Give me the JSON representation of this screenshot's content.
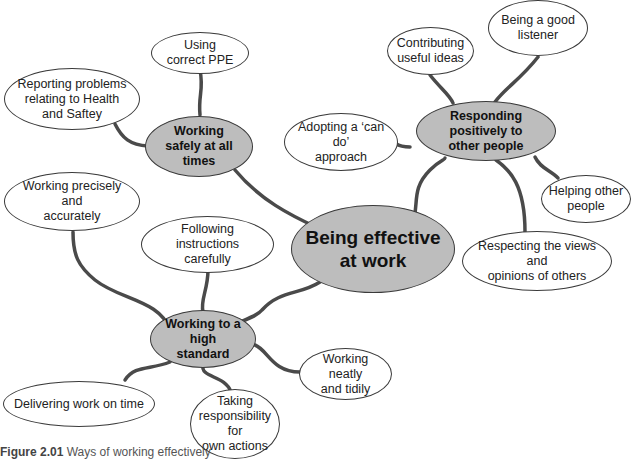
{
  "center": {
    "label_line1": "Being effective",
    "label_line2": "at work"
  },
  "hubs": {
    "safety": {
      "line1": "Working",
      "line2": "safely at all times"
    },
    "people": {
      "line1": "Responding positively to",
      "line2": "other people"
    },
    "standard": {
      "line1": "Working to a high",
      "line2": "standard"
    }
  },
  "leaves": {
    "ppe": {
      "line1": "Using",
      "line2": "correct PPE"
    },
    "reporting": {
      "line1": "Reporting problems",
      "line2": "relating to Health",
      "line3": "and Saftey"
    },
    "ideas": {
      "line1": "Contributing",
      "line2": "useful ideas"
    },
    "listener": {
      "line1": "Being a good",
      "line2": "listener"
    },
    "cando": {
      "line1": "Adopting a ‘can do’",
      "line2": "approach"
    },
    "helping": {
      "line1": "Helping other",
      "line2": "people"
    },
    "respecting": {
      "line1": "Respecting the views and",
      "line2": "opinions of others"
    },
    "precisely": {
      "line1": "Working precisely and",
      "line2": "accurately"
    },
    "instructions": {
      "line1": "Following instructions",
      "line2": "carefully"
    },
    "delivering": {
      "line1": "Delivering work on time"
    },
    "responsibility": {
      "line1": "Taking",
      "line2": "responsibility for",
      "line3": "own actions"
    },
    "neatly": {
      "line1": "Working neatly",
      "line2": "and tidily"
    }
  },
  "caption": {
    "label": "Figure 2.01",
    "text": "Ways of working effectively"
  },
  "colors": {
    "hub_fill": "#bdbdbd",
    "leaf_fill": "#ffffff",
    "stroke": "#3a3a3a"
  }
}
